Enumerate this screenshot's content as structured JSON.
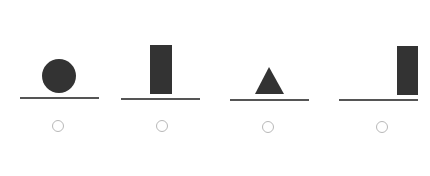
{
  "colors": {
    "shape_fill": "#333333",
    "baseline": "#555555",
    "radio_border": "#b8b8b8",
    "background": "#ffffff"
  },
  "options": [
    {
      "id": "option-1",
      "shape": "circle",
      "shape_position": "centered",
      "label": "Circle on line",
      "selected": false
    },
    {
      "id": "option-2",
      "shape": "tall-rectangle",
      "shape_position": "center-left",
      "label": "Rectangle on line",
      "selected": false
    },
    {
      "id": "option-3",
      "shape": "triangle",
      "shape_position": "center-left",
      "label": "Triangle on line",
      "selected": false
    },
    {
      "id": "option-4",
      "shape": "tall-rectangle",
      "shape_position": "right-end",
      "label": "Rectangle at right end of line",
      "selected": false
    }
  ]
}
